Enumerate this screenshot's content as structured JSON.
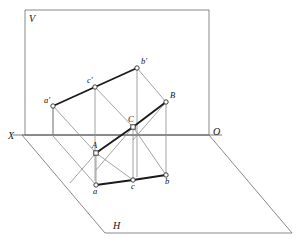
{
  "figure": {
    "width": 305,
    "height": 247,
    "background": "#ffffff",
    "line_color_thin": "#8a8a8a",
    "line_color_heavy": "#1a1a1a",
    "vertex_fill": "#ffffff",
    "vertex_stroke": "#2b2b2b"
  },
  "plane_labels": {
    "vertical_plane": "V",
    "horizontal_plane": "H",
    "origin": "O",
    "axis_x": "X"
  },
  "planes": {
    "v_plane": {
      "name": "vertical-projection-plane",
      "shape": "rectangle",
      "points": "25,10 209,10 209,135 25,135"
    },
    "h_plane": {
      "name": "horizontal-projection-plane",
      "shape": "parallelogram",
      "points": "22,135 209,135 292,233 105,233"
    },
    "ground_line": {
      "name": "XO-ground-line",
      "x1": 13,
      "y1": 135,
      "x2": 222,
      "y2": 135
    }
  },
  "vertices": [
    {
      "id": "a_prime",
      "label": "a'",
      "x": 53,
      "y": 106,
      "lx": 44,
      "ly": 103,
      "marker": "circle",
      "group": "v-projection"
    },
    {
      "id": "c_prime",
      "label": "c'",
      "x": 95,
      "y": 87,
      "lx": 87,
      "ly": 83,
      "marker": "circle",
      "group": "v-projection"
    },
    {
      "id": "b_prime",
      "label": "b'",
      "x": 137,
      "y": 68,
      "lx": 141,
      "ly": 64,
      "marker": "circle",
      "group": "v-projection"
    },
    {
      "id": "A",
      "label": "A",
      "x": 96,
      "y": 153,
      "lx": 92,
      "ly": 148,
      "marker": "square",
      "group": "space"
    },
    {
      "id": "C",
      "label": "C",
      "x": 133,
      "y": 127,
      "lx": 128,
      "ly": 122,
      "marker": "square",
      "group": "space"
    },
    {
      "id": "B",
      "label": "B",
      "x": 166,
      "y": 102,
      "lx": 170,
      "ly": 98,
      "marker": "circle",
      "group": "space"
    },
    {
      "id": "a",
      "label": "a",
      "x": 96,
      "y": 185,
      "lx": 93,
      "ly": 194,
      "marker": "circle",
      "group": "h-projection"
    },
    {
      "id": "c",
      "label": "c",
      "x": 133,
      "y": 180,
      "lx": 131,
      "ly": 189,
      "marker": "circle",
      "group": "h-projection"
    },
    {
      "id": "b",
      "label": "b",
      "x": 166,
      "y": 175,
      "lx": 165,
      "ly": 184,
      "marker": "circle",
      "group": "h-projection"
    }
  ],
  "heavy_segments": [
    {
      "name": "v-projection-triangle-edge-ac",
      "x1": 53,
      "y1": 106,
      "x2": 95,
      "y2": 87
    },
    {
      "name": "v-projection-triangle-edge-cb",
      "x1": 95,
      "y1": 87,
      "x2": 137,
      "y2": 68
    },
    {
      "name": "space-triangle-edge-AC",
      "x1": 96,
      "y1": 153,
      "x2": 133,
      "y2": 127
    },
    {
      "name": "space-triangle-edge-CB",
      "x1": 133,
      "y1": 127,
      "x2": 166,
      "y2": 102
    },
    {
      "name": "h-projection-edge-ac",
      "x1": 96,
      "y1": 185,
      "x2": 133,
      "y2": 180
    },
    {
      "name": "h-projection-edge-cb",
      "x1": 133,
      "y1": 180,
      "x2": 166,
      "y2": 175
    }
  ],
  "vertical_recall_lines": [
    {
      "name": "recall-a-prime-to-ground",
      "x1": 53,
      "y1": 106,
      "x2": 53,
      "y2": 136
    },
    {
      "name": "recall-c-prime-to-c",
      "x1": 95,
      "y1": 87,
      "x2": 95,
      "y2": 181
    },
    {
      "name": "recall-b-prime-to-b",
      "x1": 137,
      "y1": 68,
      "x2": 137,
      "y2": 177
    },
    {
      "name": "recall-A-to-a",
      "x1": 96,
      "y1": 153,
      "x2": 96,
      "y2": 185
    },
    {
      "name": "recall-C-to-c",
      "x1": 133,
      "y1": 127,
      "x2": 133,
      "y2": 180
    },
    {
      "name": "recall-B-to-b",
      "x1": 166,
      "y1": 102,
      "x2": 166,
      "y2": 175
    }
  ],
  "depth_lines": [
    {
      "name": "depth-a-prime-to-A",
      "x1": 53,
      "y1": 106,
      "x2": 96,
      "y2": 153
    },
    {
      "name": "depth-c-prime-to-C",
      "x1": 95,
      "y1": 87,
      "x2": 133,
      "y2": 127
    },
    {
      "name": "depth-b-prime-to-B",
      "x1": 137,
      "y1": 68,
      "x2": 166,
      "y2": 102
    },
    {
      "name": "depth-ground-to-a",
      "x1": 53,
      "y1": 136,
      "x2": 96,
      "y2": 185
    },
    {
      "name": "depth-A-extend",
      "x1": 96,
      "y1": 153,
      "x2": 70,
      "y2": 183
    },
    {
      "name": "depth-C-extend",
      "x1": 133,
      "y1": 127,
      "x2": 96,
      "y2": 170
    },
    {
      "name": "depth-B-extend",
      "x1": 166,
      "y1": 102,
      "x2": 133,
      "y2": 140
    }
  ],
  "thin_quad_links": [
    {
      "name": "link-a-prime-a",
      "x1": 53,
      "y1": 106,
      "x2": 53,
      "y2": 135
    },
    {
      "name": "link-A-c",
      "x1": 96,
      "y1": 153,
      "x2": 133,
      "y2": 180
    },
    {
      "name": "link-C-b",
      "x1": 133,
      "y1": 127,
      "x2": 166,
      "y2": 175
    }
  ]
}
